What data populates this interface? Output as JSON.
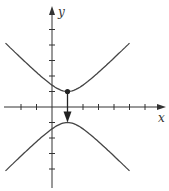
{
  "chart_data": {
    "type": "line",
    "title": "",
    "xlabel": "x",
    "ylabel": "y",
    "xlim": [
      -3,
      7.3
    ],
    "ylim": [
      -5.5,
      6.4
    ],
    "grid": false,
    "legend": null,
    "x_ticks": [
      -2,
      -1,
      1,
      2,
      3,
      4,
      5,
      6
    ],
    "y_ticks": [
      -4,
      -3,
      -2,
      -1,
      1,
      2,
      3,
      4,
      5
    ],
    "series": [
      {
        "name": "upper branch",
        "equation": "y^2 - (x-1)^2 = 1, y > 0",
        "x_range": [
          -3,
          5
        ]
      },
      {
        "name": "lower branch",
        "equation": "y^2 - (x-1)^2 = 1, y < 0",
        "x_range": [
          -3,
          5
        ]
      }
    ],
    "annotations": [
      {
        "type": "point",
        "x": 1,
        "y": 1,
        "label": ""
      },
      {
        "type": "arrow",
        "from": [
          1,
          1
        ],
        "to": [
          1,
          -1
        ],
        "label": ""
      }
    ]
  },
  "labels": {
    "x": "x",
    "y": "y"
  }
}
